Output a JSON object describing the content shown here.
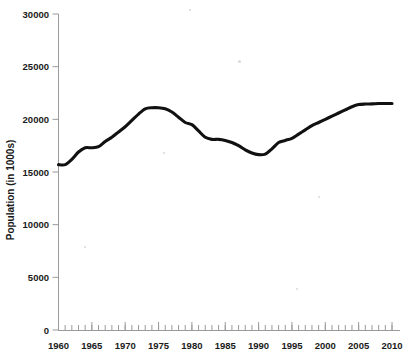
{
  "chart_data": {
    "type": "line",
    "title": "",
    "xlabel": "",
    "ylabel": "Population (in 1000s)",
    "xlim": [
      1960,
      2010
    ],
    "ylim": [
      0,
      30000
    ],
    "grid": false,
    "legend": null,
    "x_ticks": [
      1960,
      1965,
      1970,
      1975,
      1980,
      1985,
      1990,
      1995,
      2000,
      2005,
      2010
    ],
    "x_tick_labels": [
      "1960",
      "1965",
      "1970",
      "1975",
      "1980",
      "1985",
      "1990",
      "1995",
      "2000",
      "2005",
      "2010"
    ],
    "x_minor_tick_step": 1,
    "y_ticks": [
      0,
      5000,
      10000,
      15000,
      20000,
      25000,
      30000
    ],
    "y_tick_labels": [
      "0",
      "5000",
      "10000",
      "15000",
      "20000",
      "25000",
      "30000"
    ],
    "series": [
      {
        "name": "Population",
        "color": "#111111",
        "x": [
          1960,
          1961,
          1962,
          1963,
          1964,
          1965,
          1966,
          1967,
          1968,
          1969,
          1970,
          1971,
          1972,
          1973,
          1974,
          1975,
          1976,
          1977,
          1978,
          1979,
          1980,
          1981,
          1982,
          1983,
          1984,
          1985,
          1986,
          1987,
          1988,
          1989,
          1990,
          1991,
          1992,
          1993,
          1994,
          1995,
          1996,
          1997,
          1998,
          1999,
          2000,
          2001,
          2002,
          2003,
          2004,
          2005,
          2006,
          2007,
          2008,
          2009,
          2010
        ],
        "values": [
          15700,
          15700,
          16200,
          16900,
          17300,
          17300,
          17400,
          17900,
          18300,
          18800,
          19300,
          19900,
          20500,
          21000,
          21100,
          21100,
          21000,
          20700,
          20200,
          19700,
          19500,
          18900,
          18300,
          18100,
          18100,
          18000,
          17800,
          17500,
          17100,
          16800,
          16650,
          16700,
          17200,
          17800,
          18000,
          18200,
          18600,
          19000,
          19400,
          19700,
          20000,
          20300,
          20600,
          20900,
          21200,
          21400,
          21450,
          21470,
          21500,
          21500,
          21500
        ]
      }
    ]
  },
  "axes": {
    "y_axis_title": "Population (in 1000s)"
  }
}
